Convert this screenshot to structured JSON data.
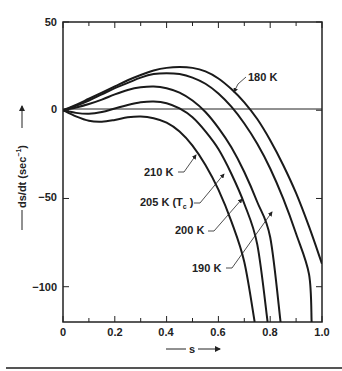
{
  "chart_data": {
    "type": "line",
    "title": "",
    "xlabel": "s",
    "ylabel": "ds/dt (sec⁻¹)",
    "xlim": [
      0,
      1.0
    ],
    "ylim": [
      -120,
      50
    ],
    "x_ticks": [
      0,
      0.2,
      0.4,
      0.6,
      0.8,
      1.0
    ],
    "x_tick_labels": [
      "0",
      "0.2",
      "0.4",
      "0.6",
      "0.8",
      "1.0"
    ],
    "y_ticks": [
      50,
      0,
      -50,
      -100
    ],
    "y_tick_labels": [
      "50",
      "0",
      "−50",
      "−100"
    ],
    "grid": false,
    "zero_line": true,
    "series": [
      {
        "name": "180 K",
        "x": [
          0,
          0.05,
          0.1,
          0.15,
          0.2,
          0.25,
          0.3,
          0.35,
          0.4,
          0.45,
          0.5,
          0.55,
          0.6,
          0.65,
          0.7,
          0.75,
          0.8,
          0.85,
          0.9,
          0.95,
          1.0
        ],
        "y": [
          0,
          3,
          6.5,
          10,
          13.5,
          17,
          20,
          22.5,
          24,
          24.5,
          24,
          22,
          18,
          12,
          4.5,
          -5,
          -17,
          -31,
          -47,
          -66,
          -87
        ]
      },
      {
        "name": "190 K",
        "x": [
          0,
          0.05,
          0.1,
          0.15,
          0.2,
          0.25,
          0.3,
          0.35,
          0.4,
          0.45,
          0.5,
          0.55,
          0.6,
          0.65,
          0.7,
          0.75,
          0.8,
          0.85,
          0.9,
          0.95,
          0.96
        ],
        "y": [
          0,
          2.5,
          5.5,
          9,
          12.5,
          15.5,
          18.5,
          20.5,
          21,
          20.5,
          18.5,
          15,
          9.5,
          2,
          -7.5,
          -19,
          -33,
          -50,
          -70,
          -93,
          -120
        ]
      },
      {
        "name": "200 K",
        "x": [
          0,
          0.05,
          0.1,
          0.15,
          0.2,
          0.25,
          0.3,
          0.35,
          0.4,
          0.45,
          0.5,
          0.55,
          0.6,
          0.65,
          0.7,
          0.75,
          0.8,
          0.84
        ],
        "y": [
          0,
          1.5,
          3.5,
          6,
          9,
          11.5,
          13,
          13.5,
          12.5,
          10,
          5.5,
          -1,
          -10,
          -21,
          -35,
          -52,
          -72,
          -120
        ]
      },
      {
        "name": "205 K (Tₑ)",
        "label_display": "205 K (Tc)",
        "x": [
          0,
          0.05,
          0.1,
          0.15,
          0.2,
          0.25,
          0.3,
          0.35,
          0.4,
          0.45,
          0.5,
          0.55,
          0.6,
          0.65,
          0.7,
          0.75,
          0.79
        ],
        "y": [
          0,
          -1.5,
          -2,
          -1,
          1,
          3,
          4.5,
          5,
          4,
          1,
          -4,
          -12,
          -22,
          -36,
          -53,
          -76,
          -120
        ]
      },
      {
        "name": "210 K",
        "x": [
          0,
          0.05,
          0.1,
          0.15,
          0.2,
          0.25,
          0.3,
          0.35,
          0.4,
          0.45,
          0.5,
          0.55,
          0.6,
          0.65,
          0.7,
          0.74
        ],
        "y": [
          0,
          -3.5,
          -6,
          -6.5,
          -5.5,
          -4,
          -3.5,
          -4.5,
          -7,
          -12,
          -20,
          -31,
          -45,
          -63,
          -86,
          -120
        ]
      }
    ],
    "annotations": [
      {
        "text": "180 K",
        "arrow_to": [
          0.54,
          12
        ]
      },
      {
        "text": "210 K",
        "arrow_to": [
          0.53,
          -22
        ]
      },
      {
        "text": "205 K (Tc)",
        "arrow_to": [
          0.64,
          -28
        ]
      },
      {
        "text": "200 K",
        "arrow_to": [
          0.71,
          -26
        ]
      },
      {
        "text": "190 K",
        "arrow_to": [
          0.85,
          -38
        ]
      }
    ]
  },
  "labels": {
    "y_axis_title_main": "ds/dt (sec",
    "y_axis_title_sup": "−1",
    "y_axis_title_end": ")",
    "x_axis_title": "s",
    "curve_180": "180 K",
    "curve_190": "190 K",
    "curve_200": "200 K",
    "curve_205_main": "205 K (T",
    "curve_205_sub": "c",
    "curve_205_end": " )",
    "curve_210": "210 K",
    "tick_x0": "0",
    "tick_x1": "0.2",
    "tick_x2": "0.4",
    "tick_x3": "0.6",
    "tick_x4": "0.8",
    "tick_x5": "1.0",
    "tick_y50": "50",
    "tick_y0": "0",
    "tick_ym50": "−50",
    "tick_ym100": "−100"
  }
}
